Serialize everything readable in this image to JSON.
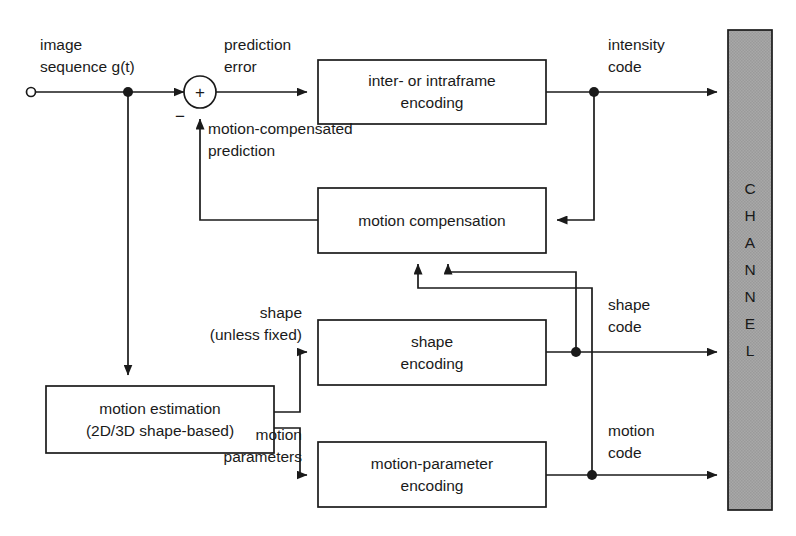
{
  "diagram": {
    "colors": {
      "line": "#1a1a1a",
      "box_fill": "#ffffff",
      "channel_fill": "#a8a8a8",
      "background": "#ffffff"
    },
    "blocks": [
      {
        "id": "inter-intraframe-encoding",
        "line1": "inter- or intraframe",
        "line2": "encoding",
        "x": 318,
        "y": 60,
        "w": 228,
        "h": 64
      },
      {
        "id": "motion-compensation",
        "line1": "motion compensation",
        "line2": "",
        "x": 318,
        "y": 188,
        "w": 228,
        "h": 65
      },
      {
        "id": "shape-encoding",
        "line1": "shape",
        "line2": "encoding",
        "x": 318,
        "y": 320,
        "w": 228,
        "h": 65
      },
      {
        "id": "motion-parameter-encoding",
        "line1": "motion-parameter",
        "line2": "encoding",
        "x": 318,
        "y": 442,
        "w": 228,
        "h": 65
      },
      {
        "id": "motion-estimation",
        "line1": "motion estimation",
        "line2": "(2D/3D shape-based)",
        "x": 46,
        "y": 386,
        "w": 228,
        "h": 67
      }
    ],
    "channel": {
      "label": "CHANNEL",
      "letters": [
        "C",
        "H",
        "A",
        "N",
        "N",
        "E",
        "L"
      ],
      "x": 728,
      "y": 30,
      "w": 44,
      "h": 480
    },
    "signal_labels": [
      {
        "id": "image-sequence",
        "line1": "image",
        "line2": "sequence g(t)",
        "x": 40,
        "y": 50
      },
      {
        "id": "prediction-error",
        "line1": "prediction",
        "line2": "error",
        "x": 224,
        "y": 50
      },
      {
        "id": "intensity-code",
        "line1": "intensity",
        "line2": "code",
        "x": 608,
        "y": 50
      },
      {
        "id": "motion-compensated-prediction",
        "line1": "motion-compensated",
        "line2": "prediction",
        "x": 208,
        "y": 134
      },
      {
        "id": "shape-unless-fixed",
        "line1": "shape",
        "line2": "(unless fixed)",
        "x": 302,
        "y": 318
      },
      {
        "id": "shape-code",
        "line1": "shape",
        "line2": "code",
        "x": 608,
        "y": 310
      },
      {
        "id": "motion-parameters",
        "line1": "motion",
        "line2": "parameters",
        "x": 302,
        "y": 440
      },
      {
        "id": "motion-code",
        "line1": "motion",
        "line2": "code",
        "x": 608,
        "y": 436
      }
    ],
    "adder": {
      "id": "summing-junction",
      "cx": 200,
      "cy": 92,
      "r": 16,
      "plus_sign": "+",
      "minus_sign": "−",
      "plus_x": 200,
      "plus_y": 98,
      "minus_x": 180,
      "minus_y": 122
    },
    "input_terminal": {
      "cx": 31,
      "cy": 92,
      "r": 4.5
    },
    "junction_dots": [
      {
        "id": "input-branch-dot",
        "cx": 128,
        "cy": 92,
        "r": 5
      },
      {
        "id": "intensity-code-dot",
        "cx": 594,
        "cy": 92,
        "r": 5
      },
      {
        "id": "shape-code-dot",
        "cx": 576,
        "cy": 352,
        "r": 5
      },
      {
        "id": "motion-code-dot",
        "cx": 592,
        "cy": 475,
        "r": 5
      }
    ]
  }
}
